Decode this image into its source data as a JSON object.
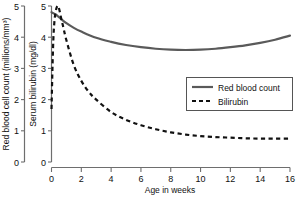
{
  "chart_data": {
    "type": "line",
    "title": "",
    "xlabel": "Age in weeks",
    "xlim": [
      0,
      16
    ],
    "xticks": [
      0,
      2,
      4,
      6,
      8,
      10,
      12,
      14,
      16
    ],
    "xtick_labels": [
      "0",
      "2",
      "4",
      "6",
      "8",
      "10",
      "12",
      "14",
      "16"
    ],
    "grid": false,
    "legend_position": "center-right",
    "axes": [
      {
        "id": "left-outer",
        "label": "Red blood cell count (millions/mm³)",
        "ylim": [
          0,
          5
        ],
        "yticks": [
          0,
          1,
          2,
          3,
          4,
          5
        ],
        "ytick_labels": [
          "0",
          "1",
          "2",
          "3",
          "4",
          "5"
        ]
      },
      {
        "id": "left-inner",
        "label": "Serum bilirubin (mg/dl)",
        "ylim": [
          0,
          5
        ],
        "yticks": [
          0,
          1,
          2,
          3,
          4,
          5
        ],
        "ytick_labels": [
          "0",
          "1",
          "2",
          "3",
          "4",
          "5"
        ]
      }
    ],
    "series": [
      {
        "name": "Red blood count",
        "axis": "left-outer",
        "style": "solid",
        "color": "#5a5a5a",
        "x": [
          0,
          0.3,
          0.6,
          1,
          1.5,
          2,
          3,
          4,
          5,
          6,
          7,
          8,
          9,
          10,
          11,
          12,
          13,
          14,
          15,
          16
        ],
        "values": [
          4.8,
          4.72,
          4.6,
          4.45,
          4.3,
          4.18,
          3.98,
          3.85,
          3.75,
          3.68,
          3.63,
          3.6,
          3.59,
          3.6,
          3.63,
          3.68,
          3.74,
          3.82,
          3.92,
          4.05
        ]
      },
      {
        "name": "Bilirubin",
        "axis": "left-inner",
        "style": "dashed",
        "color": "#111111",
        "x": [
          0,
          0.15,
          0.4,
          0.7,
          1,
          1.5,
          2,
          2.5,
          3,
          4,
          5,
          6,
          7,
          8,
          9,
          10,
          11,
          12,
          13,
          14,
          15,
          16
        ],
        "values": [
          1.7,
          4.2,
          5.0,
          4.5,
          3.9,
          3.1,
          2.6,
          2.25,
          2.0,
          1.6,
          1.35,
          1.18,
          1.05,
          0.95,
          0.88,
          0.83,
          0.8,
          0.78,
          0.76,
          0.75,
          0.75,
          0.75
        ]
      }
    ],
    "legend": [
      {
        "label": "Red blood count",
        "style": "solid"
      },
      {
        "label": "Bilirubin",
        "style": "dashed"
      }
    ]
  }
}
